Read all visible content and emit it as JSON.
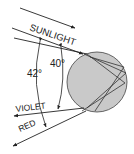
{
  "diagram": {
    "labels": {
      "sunlight": "SUNLIGHT",
      "violet": "VIOLET",
      "red": "RED",
      "angle_red": "42°",
      "angle_violet": "40°"
    },
    "colors": {
      "droplet_fill": "#c9c9c9",
      "line": "#222222",
      "background": "#ffffff"
    }
  }
}
